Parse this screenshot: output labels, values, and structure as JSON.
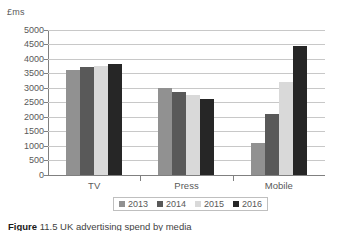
{
  "chart_data": {
    "type": "bar",
    "title": "",
    "subtitle": "",
    "xlabel": "",
    "ylabel": "£ms",
    "categories": [
      "TV",
      "Press",
      "Mobile"
    ],
    "series": [
      {
        "name": "2013",
        "color": "#919191",
        "values": [
          3600,
          3000,
          1100
        ]
      },
      {
        "name": "2014",
        "color": "#595959",
        "values": [
          3700,
          2850,
          2100
        ]
      },
      {
        "name": "2015",
        "color": "#d9d9d9",
        "values": [
          3750,
          2750,
          3200
        ]
      },
      {
        "name": "2016",
        "color": "#262626",
        "values": [
          3800,
          2600,
          4450
        ]
      }
    ],
    "ylim": [
      0,
      5000
    ],
    "ytick_step": 500,
    "yticks": [
      5000,
      4500,
      4000,
      3500,
      3000,
      2500,
      2000,
      1500,
      1000,
      500,
      0
    ],
    "ytick_labels": [
      "5000",
      "4500",
      "4000",
      "3500",
      "3000",
      "2500",
      "2000",
      "1500",
      "1000",
      "500",
      "0"
    ],
    "grid": true,
    "grid_axis": "y",
    "legend_position": "bottom",
    "legend_entries": [
      "2013",
      "2014",
      "2015",
      "2016"
    ],
    "annotations": []
  },
  "caption": {
    "label": "Figure",
    "text": "11.5 UK advertising spend by media"
  }
}
